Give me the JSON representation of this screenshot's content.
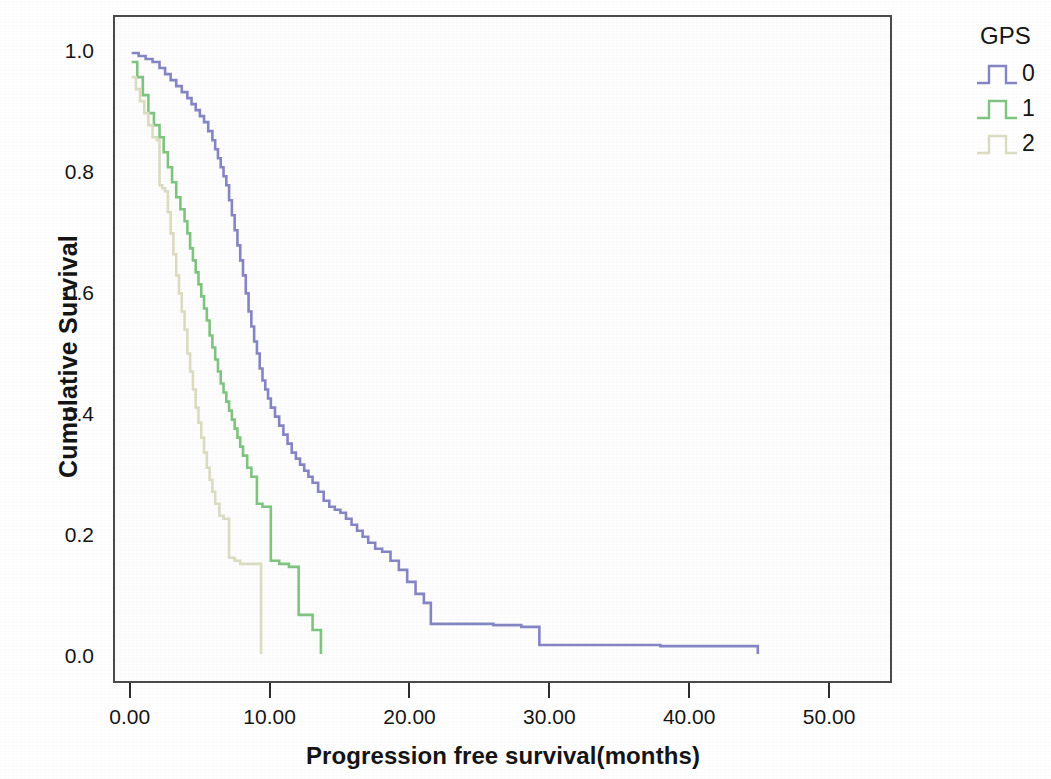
{
  "chart_data": {
    "type": "line",
    "title": "",
    "subtitle": "",
    "xlabel": "Progression free survival(months)",
    "ylabel": "Cumulative Survival",
    "xlim": [
      -1.2,
      54.5
    ],
    "ylim": [
      -0.045,
      1.06
    ],
    "xticks": [
      "0.00",
      "10.00",
      "20.00",
      "30.00",
      "40.00",
      "50.00"
    ],
    "xtick_values": [
      0,
      10,
      20,
      30,
      40,
      50
    ],
    "yticks": [
      "0.0",
      "0.2",
      "0.4",
      "0.6",
      "0.8",
      "1.0"
    ],
    "ytick_values": [
      0.0,
      0.2,
      0.4,
      0.6,
      0.8,
      1.0
    ],
    "grid": false,
    "legend_position": "right",
    "legend_title": "GPS",
    "plot_background": "#fdfdfd",
    "frame_color": "#4a4a4a",
    "series": [
      {
        "name": "0",
        "label": "0",
        "color": "#8585c4",
        "step": "hv",
        "x": [
          0.0,
          0.5,
          1.0,
          1.5,
          2.0,
          2.4,
          2.8,
          3.2,
          3.6,
          4.0,
          4.3,
          4.6,
          4.9,
          5.2,
          5.5,
          5.8,
          6.0,
          6.2,
          6.4,
          6.6,
          6.8,
          7.0,
          7.2,
          7.4,
          7.6,
          7.8,
          8.0,
          8.2,
          8.4,
          8.6,
          8.8,
          9.0,
          9.2,
          9.4,
          9.6,
          9.8,
          10.0,
          10.3,
          10.6,
          10.9,
          11.2,
          11.5,
          11.8,
          12.1,
          12.4,
          12.7,
          13.0,
          13.4,
          13.8,
          14.2,
          14.6,
          15.0,
          15.4,
          15.8,
          16.2,
          16.6,
          17.0,
          17.5,
          18.0,
          18.6,
          19.2,
          19.8,
          20.4,
          21.0,
          21.5,
          24.0,
          26.0,
          28.0,
          29.3,
          33.0,
          38.0,
          42.0,
          44.8,
          45.0
        ],
        "y": [
          1.0,
          0.995,
          0.99,
          0.985,
          0.975,
          0.965,
          0.955,
          0.945,
          0.935,
          0.925,
          0.915,
          0.905,
          0.895,
          0.885,
          0.87,
          0.855,
          0.84,
          0.825,
          0.81,
          0.795,
          0.78,
          0.755,
          0.73,
          0.705,
          0.68,
          0.655,
          0.63,
          0.6,
          0.57,
          0.545,
          0.52,
          0.5,
          0.475,
          0.455,
          0.44,
          0.425,
          0.41,
          0.395,
          0.38,
          0.365,
          0.35,
          0.335,
          0.325,
          0.315,
          0.305,
          0.295,
          0.285,
          0.27,
          0.255,
          0.245,
          0.24,
          0.235,
          0.225,
          0.215,
          0.205,
          0.195,
          0.185,
          0.175,
          0.17,
          0.155,
          0.14,
          0.12,
          0.1,
          0.085,
          0.05,
          0.05,
          0.048,
          0.045,
          0.015,
          0.015,
          0.013,
          0.013,
          0.013,
          0.0
        ]
      },
      {
        "name": "1",
        "label": "1",
        "color": "#7fc47f",
        "step": "hv",
        "x": [
          0.0,
          0.4,
          0.8,
          1.2,
          1.6,
          2.0,
          2.3,
          2.6,
          2.9,
          3.2,
          3.5,
          3.8,
          4.0,
          4.2,
          4.4,
          4.6,
          4.8,
          5.0,
          5.2,
          5.4,
          5.6,
          5.8,
          6.0,
          6.2,
          6.4,
          6.6,
          6.8,
          7.0,
          7.2,
          7.4,
          7.6,
          7.8,
          8.0,
          8.3,
          8.6,
          9.0,
          9.4,
          10.0,
          10.6,
          11.3,
          12.0,
          13.0,
          13.6
        ],
        "y": [
          0.985,
          0.96,
          0.93,
          0.9,
          0.88,
          0.86,
          0.835,
          0.81,
          0.785,
          0.76,
          0.74,
          0.72,
          0.7,
          0.675,
          0.655,
          0.635,
          0.615,
          0.595,
          0.575,
          0.555,
          0.53,
          0.51,
          0.49,
          0.47,
          0.45,
          0.435,
          0.42,
          0.405,
          0.39,
          0.375,
          0.36,
          0.345,
          0.33,
          0.31,
          0.295,
          0.25,
          0.245,
          0.155,
          0.15,
          0.145,
          0.065,
          0.04,
          0.0
        ]
      },
      {
        "name": "2",
        "label": "2",
        "color": "#dcdcc0",
        "step": "hv",
        "x": [
          0.0,
          0.3,
          0.6,
          0.9,
          1.2,
          1.5,
          1.8,
          2.0,
          2.2,
          2.4,
          2.6,
          2.8,
          3.0,
          3.2,
          3.4,
          3.6,
          3.8,
          4.0,
          4.2,
          4.4,
          4.6,
          4.8,
          5.0,
          5.2,
          5.4,
          5.6,
          5.8,
          6.0,
          6.3,
          6.6,
          7.0,
          7.4,
          7.8,
          8.2,
          8.6,
          9.0,
          9.3
        ],
        "y": [
          0.96,
          0.94,
          0.92,
          0.9,
          0.88,
          0.86,
          0.855,
          0.78,
          0.775,
          0.77,
          0.735,
          0.7,
          0.665,
          0.63,
          0.6,
          0.57,
          0.54,
          0.5,
          0.47,
          0.44,
          0.41,
          0.385,
          0.36,
          0.335,
          0.31,
          0.29,
          0.27,
          0.25,
          0.23,
          0.225,
          0.16,
          0.155,
          0.15,
          0.15,
          0.15,
          0.15,
          0.0
        ]
      }
    ]
  },
  "axes": {
    "y_title": "Cumulative Survival",
    "x_title": "Progression free survival(months)",
    "y_tick_labels": [
      "1.0",
      "0.8",
      "0.6",
      "0.4",
      "0.2",
      "0.0"
    ],
    "x_tick_labels": [
      "0.00",
      "10.00",
      "20.00",
      "30.00",
      "40.00",
      "50.00"
    ]
  },
  "legend": {
    "title": "GPS",
    "items": [
      {
        "label": "0",
        "color": "#8585c4"
      },
      {
        "label": "1",
        "color": "#7fc47f"
      },
      {
        "label": "2",
        "color": "#dcdcc0"
      }
    ]
  }
}
